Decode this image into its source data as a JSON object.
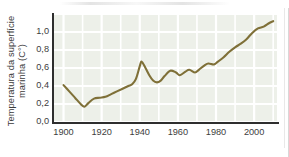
{
  "figure": {
    "name": "sea-surface-temperature-line-chart",
    "background_color": "#ffffff",
    "plot_background_color": "#edf0e9",
    "gridline_color": "#ffffff",
    "axis_color": "#2e2e2e",
    "line_color": "#7f7038",
    "tick_label_color": "#3d3d3d"
  },
  "chart_data": {
    "type": "line",
    "title": "",
    "subtitle": "",
    "xlabel": "",
    "ylabel": "Temperatura da superfície marinha (C°)",
    "xlim": [
      1895,
      2012
    ],
    "ylim": [
      0.0,
      1.2
    ],
    "grid": true,
    "legend": null,
    "xticks": [
      "1900",
      "1920",
      "1940",
      "1960",
      "1980",
      "2000"
    ],
    "xtick_values": [
      1900,
      1920,
      1940,
      1960,
      1980,
      2000
    ],
    "yticks": [
      "0,0",
      "0,2",
      "0,4",
      "0,6",
      "0,8",
      "1,0"
    ],
    "ytick_values": [
      0.0,
      0.2,
      0.4,
      0.6,
      0.8,
      1.0
    ],
    "series": [
      {
        "name": "Temperatura da superfície marinha",
        "color": "#7f7038",
        "x": [
          1900,
          1903,
          1906,
          1909,
          1911,
          1913,
          1916,
          1919,
          1922,
          1925,
          1928,
          1931,
          1934,
          1936,
          1938,
          1940,
          1941,
          1943,
          1945,
          1947,
          1949,
          1951,
          1953,
          1956,
          1959,
          1961,
          1964,
          1966,
          1969,
          1971,
          1974,
          1976,
          1979,
          1981,
          1984,
          1987,
          1990,
          1993,
          1996,
          1999,
          2002,
          2005,
          2008,
          2010
        ],
        "values": [
          0.41,
          0.34,
          0.27,
          0.2,
          0.17,
          0.21,
          0.26,
          0.27,
          0.28,
          0.31,
          0.34,
          0.37,
          0.4,
          0.42,
          0.48,
          0.62,
          0.67,
          0.6,
          0.52,
          0.46,
          0.44,
          0.46,
          0.51,
          0.57,
          0.55,
          0.52,
          0.56,
          0.58,
          0.55,
          0.58,
          0.63,
          0.65,
          0.64,
          0.67,
          0.72,
          0.78,
          0.83,
          0.87,
          0.92,
          0.99,
          1.04,
          1.06,
          1.1,
          1.12
        ]
      }
    ]
  }
}
